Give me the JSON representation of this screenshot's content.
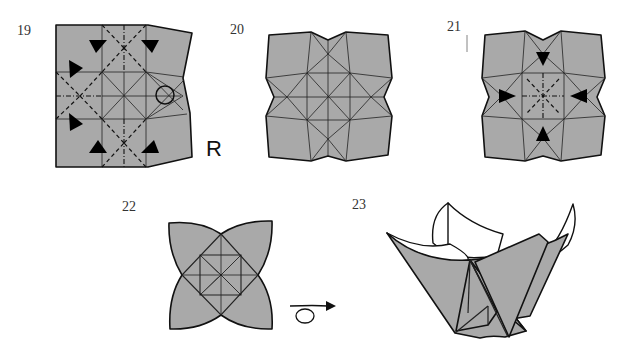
{
  "steps": [
    {
      "number": "19",
      "label": "R",
      "marks": [
        "valley-folds",
        "mountain-folds",
        "push-arrows",
        "circle-marker"
      ]
    },
    {
      "number": "20",
      "marks": [
        "crease-pattern"
      ]
    },
    {
      "number": "21",
      "marks": [
        "push-arrows",
        "valley-folds",
        "mountain-folds"
      ]
    },
    {
      "number": "22",
      "marks": [
        "turn-over-arrow"
      ]
    },
    {
      "number": "23",
      "marks": [
        "finished-model"
      ]
    }
  ],
  "colors": {
    "paper": "#a9a9a9",
    "line": "#111111",
    "background": "#ffffff"
  }
}
